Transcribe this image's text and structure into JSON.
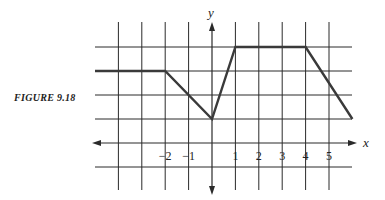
{
  "figure": {
    "caption": "FIGURE 9.18"
  },
  "chart_data": {
    "type": "line",
    "title": "",
    "caption": "FIGURE 9.18",
    "xlabel": "x",
    "ylabel": "y",
    "x_tick_labels": [
      "-2",
      "-1",
      "1",
      "2",
      "3",
      "4",
      "5"
    ],
    "x_ticks": [
      -2,
      -1,
      1,
      2,
      3,
      4,
      5
    ],
    "grid": true,
    "grid_x": [
      -4,
      -3,
      -2,
      -1,
      1,
      2,
      3,
      4,
      5
    ],
    "grid_y": [
      -1,
      1,
      2,
      3,
      4
    ],
    "xlim": [
      -5,
      6
    ],
    "ylim": [
      -2,
      5
    ],
    "series": [
      {
        "name": "graph",
        "x": [
          -5,
          -2,
          0,
          1,
          4,
          6
        ],
        "y": [
          3,
          3,
          1,
          4,
          4,
          1
        ]
      }
    ]
  }
}
